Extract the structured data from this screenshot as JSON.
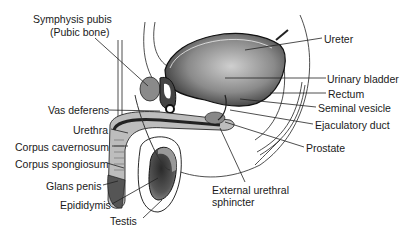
{
  "diagram": {
    "labels_left": [
      {
        "id": "symphysis",
        "text": "Symphysis pubis",
        "x": 33,
        "y": 19
      },
      {
        "id": "symphysis2",
        "text": "(Pubic bone)",
        "x": 50,
        "y": 32
      },
      {
        "id": "vas",
        "text": "Vas deferens",
        "x": 48,
        "y": 104
      },
      {
        "id": "urethra",
        "text": "Urethra",
        "x": 73,
        "y": 124
      },
      {
        "id": "cavernosum",
        "text": "Corpus cavernosum",
        "x": 15,
        "y": 141
      },
      {
        "id": "spongiosum",
        "text": "Corpus spongiosum",
        "x": 15,
        "y": 158
      },
      {
        "id": "glans",
        "text": "Glans penis",
        "x": 46,
        "y": 180
      },
      {
        "id": "epididymis",
        "text": "Epididymis",
        "x": 60,
        "y": 199
      },
      {
        "id": "testis",
        "text": "Testis",
        "x": 110,
        "y": 215
      }
    ],
    "labels_right": [
      {
        "id": "ureter",
        "text": "Ureter",
        "x": 324,
        "y": 33
      },
      {
        "id": "bladder",
        "text": "Urinary bladder",
        "x": 327,
        "y": 73
      },
      {
        "id": "rectum",
        "text": "Rectum",
        "x": 328,
        "y": 88
      },
      {
        "id": "seminal",
        "text": "Seminal vesicle",
        "x": 318,
        "y": 102
      },
      {
        "id": "ejac",
        "text": "Ejaculatory duct",
        "x": 315,
        "y": 119
      },
      {
        "id": "prostate",
        "text": "Prostate",
        "x": 306,
        "y": 142
      },
      {
        "id": "sphincter",
        "text": "External urethral",
        "x": 212,
        "y": 184
      },
      {
        "id": "sphincter2",
        "text": "sphincter",
        "x": 212,
        "y": 196
      }
    ]
  }
}
